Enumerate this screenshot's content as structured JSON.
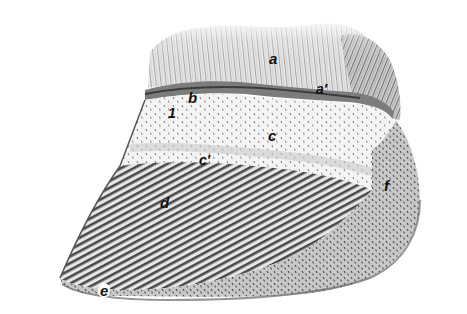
{
  "figure": {
    "colors": {
      "background": "#ffffff",
      "hair": "#9a9a9a",
      "hair_dark": "#555555",
      "coronary_band": "#6e6e6e",
      "periople_fill": "#f2f2f2",
      "stipple": "#777777",
      "wall_stripe": "#4a4a4a",
      "wall_fill": "#d8d8d8",
      "heel_fill": "#bdbdbd",
      "label": "#111111"
    },
    "labels": [
      {
        "id": "a",
        "text": "a",
        "x": 269,
        "y": 51
      },
      {
        "id": "a-prime",
        "text": "a′",
        "x": 316,
        "y": 82
      },
      {
        "id": "b",
        "text": "b",
        "x": 188,
        "y": 90
      },
      {
        "id": "one",
        "text": "1",
        "x": 168,
        "y": 106
      },
      {
        "id": "c",
        "text": "c",
        "x": 268,
        "y": 128
      },
      {
        "id": "c-prime",
        "text": "c′",
        "x": 199,
        "y": 153
      },
      {
        "id": "d",
        "text": "d",
        "x": 160,
        "y": 195
      },
      {
        "id": "e",
        "text": "e",
        "x": 98,
        "y": 283
      },
      {
        "id": "f",
        "text": "f",
        "x": 384,
        "y": 178
      }
    ]
  }
}
